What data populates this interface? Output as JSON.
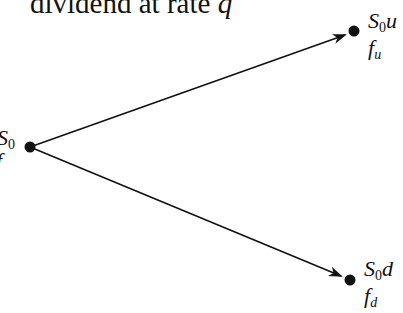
{
  "title": {
    "prefix": "dividend at rate ",
    "variable": "q"
  },
  "nodes": {
    "root": {
      "S_symbol": "S",
      "S_sub": "0",
      "f_symbol": "f",
      "x": 30,
      "y": 147
    },
    "up": {
      "S_symbol": "S",
      "S_sub": "0",
      "S_suffix": "u",
      "f_symbol": "f",
      "f_sub": "u",
      "x": 354,
      "y": 31
    },
    "down": {
      "S_symbol": "S",
      "S_sub": "0",
      "S_suffix": "d",
      "f_symbol": "f",
      "f_sub": "d",
      "x": 350,
      "y": 280
    }
  },
  "colors": {
    "ink": "#111111",
    "background": "#ffffff"
  }
}
